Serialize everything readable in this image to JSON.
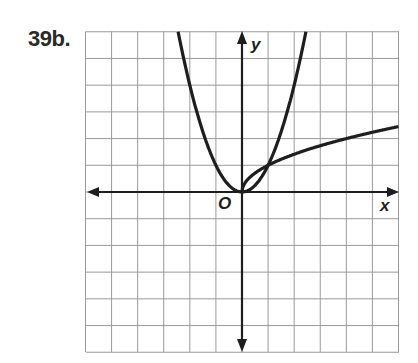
{
  "problem": {
    "label": "39b."
  },
  "axes": {
    "x_label": "x",
    "y_label": "y",
    "origin_label": "O"
  },
  "colors": {
    "grid": "#9a9a9a",
    "axis": "#1e1e1e",
    "curve": "#1e1e1e",
    "background": "#ffffff"
  },
  "chart_data": {
    "type": "line",
    "title": "39b.",
    "xlabel": "x",
    "ylabel": "y",
    "xlim": [
      -6,
      6
    ],
    "ylim": [
      -6,
      6
    ],
    "grid": true,
    "grid_step": 1,
    "legend": "none",
    "annotations": [
      "O (origin)"
    ],
    "series": [
      {
        "name": "y = x^2",
        "x": [
          -2.45,
          -2,
          -1.5,
          -1,
          -0.5,
          0,
          0.5,
          1,
          1.5,
          2,
          2.45
        ],
        "y": [
          6,
          4,
          2.25,
          1,
          0.25,
          0,
          0.25,
          1,
          2.25,
          4,
          6
        ]
      },
      {
        "name": "y = sqrt(x)",
        "x": [
          0,
          0.25,
          0.5,
          1,
          2,
          3,
          4,
          5,
          6
        ],
        "y": [
          0,
          0.5,
          0.71,
          1,
          1.41,
          1.73,
          2,
          2.24,
          2.45
        ]
      }
    ],
    "intersections": [
      [
        0,
        0
      ],
      [
        1,
        1
      ]
    ]
  }
}
